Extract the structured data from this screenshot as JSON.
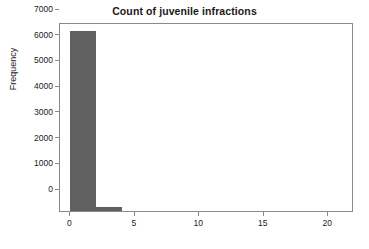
{
  "chart_data": {
    "type": "bar",
    "title": "Count of juvenile infractions",
    "xlabel": "",
    "ylabel": "Frequency",
    "bin_edges": [
      0,
      2,
      4,
      6,
      8,
      10,
      12,
      14,
      16,
      18,
      20,
      22
    ],
    "categories": [
      "0-2",
      "2-4",
      "4-6",
      "6-8",
      "8-10",
      "10-12",
      "12-14",
      "14-16",
      "16-18",
      "18-20",
      "20-22"
    ],
    "values": [
      7000,
      170,
      0,
      0,
      0,
      0,
      0,
      0,
      0,
      0,
      0
    ],
    "bars": [
      {
        "x0": 0,
        "x1": 2,
        "value": 7000
      },
      {
        "x0": 2,
        "x1": 4,
        "value": 170
      }
    ],
    "xlim": [
      -0.8,
      22
    ],
    "ylim": [
      0,
      7350
    ],
    "xticks": [
      0,
      5,
      10,
      15,
      20
    ],
    "xticklabels": [
      "0",
      "5",
      "10",
      "15",
      "20"
    ],
    "yticks": [
      0,
      1000,
      2000,
      3000,
      4000,
      5000,
      6000,
      7000
    ],
    "yticklabels": [
      "0",
      "1000",
      "2000",
      "3000",
      "4000",
      "5000",
      "6000",
      "7000"
    ],
    "grid": false,
    "legend": null,
    "bar_color": "#606060",
    "frame_color": "#8a8a8a",
    "background_color": "#ffffff",
    "text_color": "#1a1a1a"
  }
}
